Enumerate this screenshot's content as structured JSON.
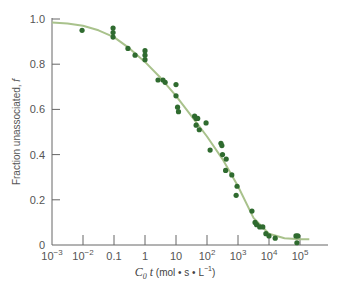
{
  "chart_data": {
    "type": "scatter",
    "title": "",
    "xlabel": "C0 t (mol · s · L^-1)",
    "xlabel_parts": {
      "main": "C",
      "sub": "0",
      "var": " t",
      "units": " (mol • s • L",
      "exp": "−1",
      "close": ")"
    },
    "ylabel": "Fraction unassociated, f",
    "xscale": "log",
    "xlim": [
      0.001,
      100000
    ],
    "ylim": [
      0,
      1.0
    ],
    "x_ticks": [
      {
        "value": -3,
        "base": "10",
        "exp": "−3"
      },
      {
        "value": -2,
        "base": "10",
        "exp": "−2"
      },
      {
        "value": -1,
        "label": "0.1"
      },
      {
        "value": 0,
        "label": "1"
      },
      {
        "value": 1,
        "label": "10"
      },
      {
        "value": 2,
        "base": "10",
        "exp": "2"
      },
      {
        "value": 3,
        "base": "10",
        "exp": "3"
      },
      {
        "value": 4,
        "base": "10",
        "exp": "4"
      },
      {
        "value": 5,
        "base": "10",
        "exp": "5"
      }
    ],
    "y_ticks": [
      {
        "value": 0,
        "label": "0"
      },
      {
        "value": 0.2,
        "label": "0.2"
      },
      {
        "value": 0.4,
        "label": "0.4"
      },
      {
        "value": 0.6,
        "label": "0.6"
      },
      {
        "value": 0.8,
        "label": "0.8"
      },
      {
        "value": 1.0,
        "label": "1.0"
      }
    ],
    "grid": false,
    "legend": null,
    "series": [
      {
        "name": "measured",
        "kind": "points",
        "color": "#2f6b2f",
        "log_x": [
          -2.03,
          -1.03,
          -1.03,
          -1.03,
          -0.55,
          -0.32,
          0.0,
          0.0,
          0.0,
          0.42,
          0.58,
          0.65,
          1.0,
          1.0,
          1.05,
          1.08,
          1.6,
          1.65,
          1.7,
          1.65,
          1.75,
          1.97,
          2.1,
          2.45,
          2.48,
          2.5,
          2.62,
          2.6,
          2.8,
          2.97,
          2.94,
          3.45,
          3.55,
          3.6,
          3.7,
          3.8,
          3.9,
          4.0,
          4.2,
          4.87,
          4.93,
          4.9
        ],
        "f": [
          0.95,
          0.96,
          0.94,
          0.92,
          0.87,
          0.84,
          0.86,
          0.84,
          0.82,
          0.73,
          0.73,
          0.72,
          0.71,
          0.66,
          0.61,
          0.59,
          0.57,
          0.56,
          0.56,
          0.53,
          0.51,
          0.54,
          0.42,
          0.45,
          0.44,
          0.4,
          0.38,
          0.33,
          0.31,
          0.26,
          0.22,
          0.15,
          0.1,
          0.09,
          0.08,
          0.08,
          0.05,
          0.04,
          0.03,
          0.04,
          0.04,
          0.01
        ]
      },
      {
        "name": "fit curve",
        "kind": "line",
        "color": "#a9c28c",
        "log_x": [
          -3,
          -2.5,
          -2,
          -1.5,
          -1,
          -0.5,
          0,
          0.5,
          1,
          1.5,
          2,
          2.5,
          3,
          3.5,
          4,
          4.5,
          5,
          5.3
        ],
        "f": [
          0.985,
          0.98,
          0.97,
          0.95,
          0.92,
          0.87,
          0.81,
          0.74,
          0.66,
          0.57,
          0.48,
          0.38,
          0.26,
          0.12,
          0.05,
          0.03,
          0.025,
          0.025
        ]
      }
    ]
  }
}
